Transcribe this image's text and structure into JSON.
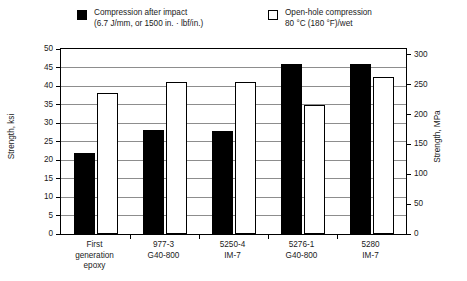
{
  "legend": {
    "entries": [
      {
        "marker": "filled-square-swatch",
        "line1": "Compression after impact",
        "line2": "(6.7 J/mm, or 1500 in. · lbf/in.)"
      },
      {
        "marker": "hollow-square-swatch",
        "line1": "Open-hole compression",
        "line2": "80 °C (180 °F)/wet"
      }
    ]
  },
  "chart_data": {
    "type": "bar",
    "title": "",
    "xlabel": "",
    "ylabel": "Strength, ksi",
    "ylabel_secondary": "Strength, MPa",
    "ylim": [
      0,
      50
    ],
    "ylim_secondary": [
      0,
      310
    ],
    "yticks": [
      0,
      5,
      10,
      15,
      20,
      25,
      30,
      35,
      40,
      45,
      50
    ],
    "yticklabels": [
      "0",
      "5",
      "10",
      "15",
      "20",
      "25",
      "30",
      "35",
      "40",
      "45",
      "50"
    ],
    "yticks_secondary": [
      0,
      50,
      100,
      150,
      200,
      250,
      300
    ],
    "yticklabels_secondary": [
      "0",
      "50",
      "100",
      "150",
      "200",
      "250",
      "300"
    ],
    "grid": true,
    "legend_position": "above",
    "categories": [
      [
        "First",
        "generation",
        "epoxy"
      ],
      [
        "977-3",
        "G40-800"
      ],
      [
        "5250-4",
        "IM-7"
      ],
      [
        "5276-1",
        "G40-800"
      ],
      [
        "5280",
        "IM-7"
      ]
    ],
    "series": [
      {
        "name": "Compression after impact",
        "fill": "#000000",
        "values": [
          22.0,
          28.0,
          27.8,
          46.0,
          46.0
        ]
      },
      {
        "name": "Open-hole compression",
        "fill": "#ffffff",
        "values": [
          38.0,
          41.0,
          41.0,
          34.8,
          42.5
        ]
      }
    ]
  }
}
